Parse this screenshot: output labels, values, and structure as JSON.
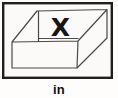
{
  "card": {
    "label": "in",
    "illustration": {
      "name": "open-box-with-x-inside",
      "x_mark": "X"
    },
    "colors": {
      "frame": "#1f1f1f",
      "line": "#4a4a4a",
      "x_mark": "#161616",
      "card_bg": "#fbfaf8",
      "label": "#121212"
    }
  }
}
